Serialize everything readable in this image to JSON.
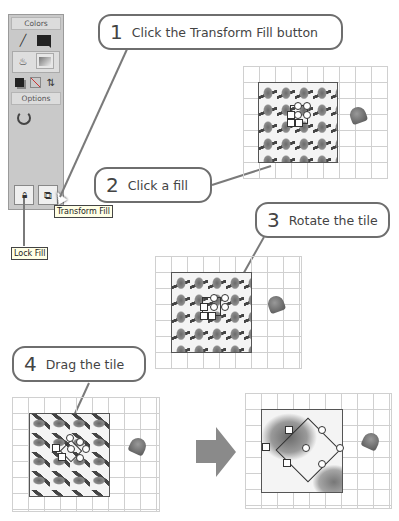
{
  "toolbar": {
    "colors_header": "Colors",
    "options_header": "Options",
    "tools": [
      {
        "name": "stroke-color",
        "icon": "pencil-icon"
      },
      {
        "name": "stroke-swatch",
        "icon": "color-swatch-icon"
      },
      {
        "name": "fill-color",
        "icon": "paint-bucket-icon"
      },
      {
        "name": "fill-swatch",
        "icon": "gradient-swatch-icon"
      },
      {
        "name": "default-colors",
        "icon": "default-colors-icon"
      },
      {
        "name": "no-color",
        "icon": "no-color-icon"
      },
      {
        "name": "swap-colors",
        "icon": "swap-icon"
      }
    ],
    "options": {
      "gap_size": "gap-size-icon",
      "lock_fill": "lock-icon",
      "transform_fill": "transform-fill-icon"
    }
  },
  "tooltips": {
    "transform_fill": "Transform Fill",
    "lock_fill": "Lock Fill"
  },
  "steps": [
    {
      "number": "1",
      "text": "Click the Transform Fill button"
    },
    {
      "number": "2",
      "text": "Click a fill"
    },
    {
      "number": "3",
      "text": "Rotate the tile"
    },
    {
      "number": "4",
      "text": "Drag the tile"
    }
  ],
  "colors": {
    "callout_border": "#6e6e6e",
    "panel_bg": "#c9c9c9",
    "grid_line": "#d0d0d0",
    "arrow": "#8a8a8a"
  }
}
